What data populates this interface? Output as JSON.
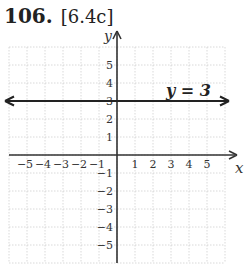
{
  "header": {
    "number": "106.",
    "reference": "[6.4c]"
  },
  "chart_data": {
    "type": "line",
    "title": "",
    "xlabel": "x",
    "ylabel": "y",
    "xlim": [
      -6,
      6
    ],
    "ylim": [
      -6,
      6
    ],
    "x_ticks": [
      "-5",
      "-4",
      "-3",
      "-2",
      "-1",
      "1",
      "2",
      "3",
      "4",
      "5"
    ],
    "y_ticks": [
      "5",
      "4",
      "3",
      "2",
      "1",
      "-1",
      "-2",
      "-3",
      "-4",
      "-5"
    ],
    "grid": true,
    "series": [
      {
        "name": "y = 3",
        "equation": "y = 3",
        "x": [
          -6,
          6
        ],
        "y": [
          3,
          3
        ]
      }
    ],
    "annotations": [
      {
        "text": "y = 3",
        "x": 3.5,
        "y": 3.6
      }
    ]
  },
  "labels": {
    "x_axis": "x",
    "y_axis": "y",
    "line_label": "y = 3"
  }
}
